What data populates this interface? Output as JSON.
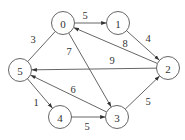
{
  "graph": {
    "type": "directed-weighted-graph",
    "node_radius": 11.5,
    "nodes": [
      {
        "id": "0",
        "label": "0",
        "x": 63,
        "y": 23
      },
      {
        "id": "1",
        "label": "1",
        "x": 118,
        "y": 23
      },
      {
        "id": "2",
        "label": "2",
        "x": 168,
        "y": 68
      },
      {
        "id": "3",
        "label": "3",
        "x": 117,
        "y": 117
      },
      {
        "id": "4",
        "label": "4",
        "x": 60,
        "y": 117
      },
      {
        "id": "5",
        "label": "5",
        "x": 20,
        "y": 70
      }
    ],
    "edges": [
      {
        "from": "0",
        "to": "1",
        "weight": "5",
        "directed": true,
        "lx": 85,
        "ly": 15
      },
      {
        "from": "1",
        "to": "2",
        "weight": "4",
        "directed": true,
        "lx": 148,
        "ly": 38
      },
      {
        "from": "2",
        "to": "0",
        "weight": "8",
        "directed": true,
        "lx": 125,
        "ly": 43
      },
      {
        "from": "2",
        "to": "5",
        "weight": "9",
        "directed": true,
        "lx": 112,
        "ly": 60
      },
      {
        "from": "0",
        "to": "3",
        "weight": "7",
        "directed": true,
        "lx": 69,
        "ly": 51
      },
      {
        "from": "0",
        "to": "5",
        "weight": "3",
        "directed": false,
        "lx": 33,
        "ly": 39
      },
      {
        "from": "3",
        "to": "5",
        "weight": "6",
        "directed": true,
        "lx": 73,
        "ly": 89
      },
      {
        "from": "5",
        "to": "4",
        "weight": "1",
        "directed": true,
        "lx": 36,
        "ly": 102
      },
      {
        "from": "4",
        "to": "3",
        "weight": "5",
        "directed": true,
        "lx": 87,
        "ly": 126
      },
      {
        "from": "3",
        "to": "2",
        "weight": "5",
        "directed": true,
        "lx": 148,
        "ly": 101
      }
    ]
  }
}
